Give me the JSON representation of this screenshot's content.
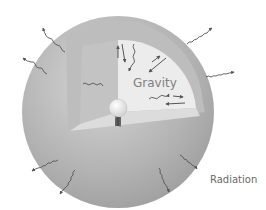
{
  "diagram": {
    "labels": {
      "gravity": "Gravity",
      "radiation": "Radiation"
    },
    "icons": {
      "sphere": "star-sphere",
      "cutaway": "interior-cutaway",
      "core": "core-ball",
      "spring": "pressure-spring",
      "wavy_arrow": "radiation-wavy-arrow",
      "straight_arrow": "gravity-arrow"
    },
    "colors": {
      "outer_shell": "#a8a8a8",
      "outer_highlight": "#d0d0d0",
      "inner_wall": "#c6c6c6",
      "inner_face": "#ececec",
      "floor": "#d9d9d9",
      "arrows": "#555555",
      "text": "#6f6f6f"
    }
  }
}
